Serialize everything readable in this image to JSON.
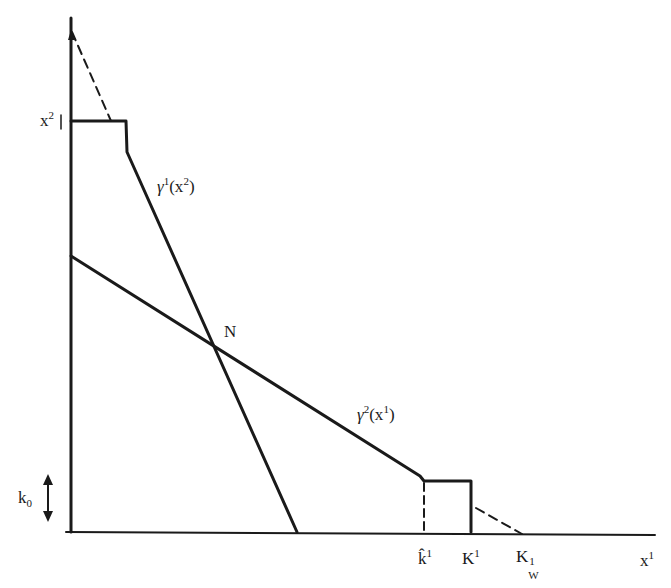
{
  "figure": {
    "type": "reaction-curve diagram",
    "axes": {
      "x_label": "x",
      "x_label_sup": "1",
      "y_label": "x",
      "y_label_sup": "2"
    },
    "curves": {
      "gamma1": {
        "name": "γ",
        "sup": "1",
        "arg": "(x",
        "arg_sup": "2",
        "arg_close": ")"
      },
      "gamma2": {
        "name": "γ",
        "sup": "2",
        "arg": "(x",
        "arg_sup": "1",
        "arg_close": ")"
      }
    },
    "intersection_label": "N",
    "x_ticks": {
      "khat": {
        "base": "k̂",
        "sup": "1"
      },
      "K": {
        "base": "K",
        "sup": "1"
      },
      "Kw": {
        "base": "K",
        "sup": "1",
        "sub": "W"
      }
    },
    "k0": {
      "base": "k",
      "sub": "0"
    },
    "line_color": "#1a1a1a"
  }
}
